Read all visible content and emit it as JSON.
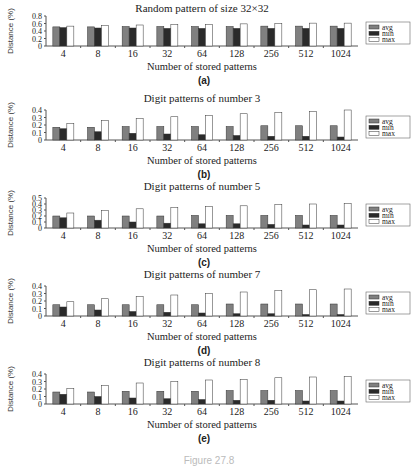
{
  "colors": {
    "avg": "#808080",
    "min": "#2a2a2a",
    "max": "#ffffff",
    "axis": "#555555"
  },
  "caption": "Figure 27.8",
  "chart_data": [
    {
      "type": "bar",
      "panel": "(a)",
      "title": "Random pattern of size 32×32",
      "xlabel": "Number of stored patterns",
      "ylabel": "Distance (%)",
      "ylim": [
        0,
        0.8
      ],
      "yticks": [
        "0",
        "0.2",
        "0.4",
        "0.6",
        "0.8"
      ],
      "categories": [
        "4",
        "8",
        "16",
        "32",
        "64",
        "128",
        "256",
        "512",
        "1024"
      ],
      "legend": [
        "avg",
        "min",
        "max"
      ],
      "legend_position": "right",
      "series": [
        {
          "name": "avg",
          "values": [
            0.51,
            0.51,
            0.52,
            0.52,
            0.52,
            0.52,
            0.53,
            0.53,
            0.53
          ]
        },
        {
          "name": "min",
          "values": [
            0.49,
            0.48,
            0.48,
            0.47,
            0.47,
            0.47,
            0.47,
            0.47,
            0.47
          ]
        },
        {
          "name": "max",
          "values": [
            0.53,
            0.55,
            0.56,
            0.57,
            0.58,
            0.59,
            0.6,
            0.61,
            0.61
          ]
        }
      ]
    },
    {
      "type": "bar",
      "panel": "(b)",
      "title": "Digit patterns of number 3",
      "xlabel": "Number of stored patterns",
      "ylabel": "Distance (%)",
      "ylim": [
        0,
        0.4
      ],
      "yticks": [
        "0",
        "0.1",
        "0.2",
        "0.3",
        "0.4"
      ],
      "categories": [
        "4",
        "8",
        "16",
        "32",
        "64",
        "128",
        "256",
        "512",
        "1024"
      ],
      "legend": [
        "avg",
        "min",
        "max"
      ],
      "legend_position": "right",
      "series": [
        {
          "name": "avg",
          "values": [
            0.17,
            0.17,
            0.18,
            0.18,
            0.18,
            0.18,
            0.19,
            0.19,
            0.19
          ]
        },
        {
          "name": "min",
          "values": [
            0.15,
            0.11,
            0.09,
            0.08,
            0.07,
            0.06,
            0.05,
            0.05,
            0.04
          ]
        },
        {
          "name": "max",
          "values": [
            0.22,
            0.26,
            0.29,
            0.31,
            0.33,
            0.35,
            0.37,
            0.38,
            0.4
          ]
        }
      ]
    },
    {
      "type": "bar",
      "panel": "(c)",
      "title": "Digit patterns of number 5",
      "xlabel": "Number of stored patterns",
      "ylabel": "Distance (%)",
      "ylim": [
        0,
        0.5
      ],
      "yticks": [
        "0",
        "0.1",
        "0.2",
        "0.3",
        "0.4",
        "0.5"
      ],
      "categories": [
        "4",
        "8",
        "16",
        "32",
        "64",
        "128",
        "256",
        "512",
        "1024"
      ],
      "legend": [
        "avg",
        "min",
        "max"
      ],
      "legend_position": "right",
      "series": [
        {
          "name": "avg",
          "values": [
            0.2,
            0.2,
            0.2,
            0.2,
            0.21,
            0.21,
            0.21,
            0.21,
            0.21
          ]
        },
        {
          "name": "min",
          "values": [
            0.17,
            0.13,
            0.1,
            0.08,
            0.07,
            0.07,
            0.06,
            0.05,
            0.05
          ]
        },
        {
          "name": "max",
          "values": [
            0.25,
            0.29,
            0.32,
            0.34,
            0.36,
            0.37,
            0.39,
            0.4,
            0.41
          ]
        }
      ]
    },
    {
      "type": "bar",
      "panel": "(d)",
      "title": "Digit patterns of number 7",
      "xlabel": "Number of stored patterns",
      "ylabel": "Distance (%)",
      "ylim": [
        0,
        0.4
      ],
      "yticks": [
        "0",
        "0.1",
        "0.2",
        "0.3",
        "0.4"
      ],
      "categories": [
        "4",
        "8",
        "16",
        "32",
        "64",
        "128",
        "256",
        "512",
        "1024"
      ],
      "legend": [
        "avg",
        "min",
        "max"
      ],
      "legend_position": "right",
      "series": [
        {
          "name": "avg",
          "values": [
            0.15,
            0.15,
            0.15,
            0.15,
            0.15,
            0.16,
            0.16,
            0.16,
            0.16
          ]
        },
        {
          "name": "min",
          "values": [
            0.12,
            0.08,
            0.06,
            0.05,
            0.04,
            0.03,
            0.03,
            0.02,
            0.02
          ]
        },
        {
          "name": "max",
          "values": [
            0.19,
            0.23,
            0.26,
            0.28,
            0.3,
            0.32,
            0.34,
            0.35,
            0.36
          ]
        }
      ]
    },
    {
      "type": "bar",
      "panel": "(e)",
      "title": "Digit patterns of number 8",
      "xlabel": "Number of stored patterns",
      "ylabel": "Distance (%)",
      "ylim": [
        0,
        0.4
      ],
      "yticks": [
        "0",
        "0.1",
        "0.2",
        "0.3",
        "0.4"
      ],
      "categories": [
        "4",
        "8",
        "16",
        "32",
        "64",
        "128",
        "256",
        "512",
        "1024"
      ],
      "legend": [
        "avg",
        "min",
        "max"
      ],
      "legend_position": "right",
      "series": [
        {
          "name": "avg",
          "values": [
            0.16,
            0.16,
            0.17,
            0.17,
            0.17,
            0.18,
            0.18,
            0.18,
            0.18
          ]
        },
        {
          "name": "min",
          "values": [
            0.13,
            0.1,
            0.08,
            0.07,
            0.06,
            0.05,
            0.05,
            0.04,
            0.04
          ]
        },
        {
          "name": "max",
          "values": [
            0.21,
            0.25,
            0.28,
            0.3,
            0.32,
            0.33,
            0.35,
            0.36,
            0.37
          ]
        }
      ]
    }
  ]
}
